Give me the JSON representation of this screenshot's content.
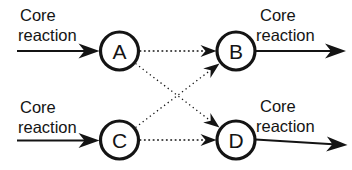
{
  "diagram": {
    "nodes": [
      {
        "id": "A",
        "label": "A"
      },
      {
        "id": "B",
        "label": "B"
      },
      {
        "id": "C",
        "label": "C"
      },
      {
        "id": "D",
        "label": "D"
      }
    ],
    "edges": [
      {
        "from": "A",
        "to": "B",
        "style": "dotted-arrow"
      },
      {
        "from": "A",
        "to": "D",
        "style": "dotted-arrow"
      },
      {
        "from": "C",
        "to": "B",
        "style": "dotted-arrow"
      },
      {
        "from": "C",
        "to": "D",
        "style": "dotted-arrow"
      }
    ],
    "io_labels": {
      "top_left": {
        "line1": "Core",
        "line2": "reaction"
      },
      "bottom_left": {
        "line1": "Core",
        "line2": "reaction"
      },
      "top_right": {
        "line1": "Core",
        "line2": "reaction"
      },
      "bottom_right": {
        "line1": "Core",
        "line2": "reaction"
      }
    },
    "io_arrows": [
      {
        "position": "top-left",
        "style": "solid-arrow",
        "points_to": "A"
      },
      {
        "position": "bottom-left",
        "style": "solid-arrow",
        "points_to": "C"
      },
      {
        "position": "top-right",
        "style": "solid-arrow",
        "points_from": "B"
      },
      {
        "position": "bottom-right",
        "style": "solid-arrow",
        "points_from": "D"
      }
    ],
    "colors": {
      "ink": "#141414",
      "background": "#ffffff"
    }
  }
}
